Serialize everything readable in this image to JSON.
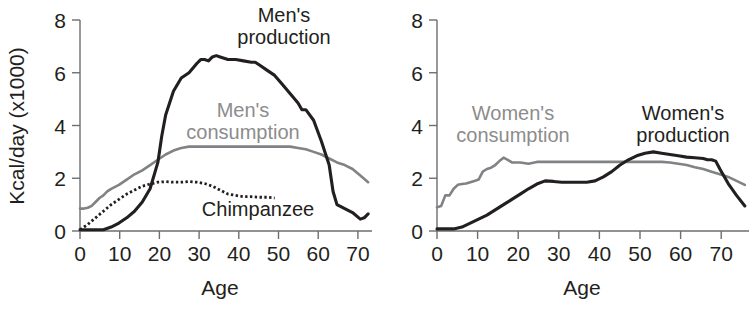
{
  "figure": {
    "title": "",
    "background_color": "#ffffff",
    "colors": {
      "dark": "#231f20",
      "gray": "#808285",
      "gray_label": "#8c8c8c",
      "axis": "#6d6e71"
    }
  },
  "panels": [
    {
      "id": "men",
      "ylabel": "Kcal/day (x1000)",
      "xlabel": "Age",
      "y_ticks": [
        "0",
        "2",
        "4",
        "6",
        "8"
      ],
      "x_ticks": [
        "0",
        "10",
        "20",
        "30",
        "40",
        "50",
        "60",
        "70"
      ],
      "labels": [
        {
          "name": "mens-production-label",
          "line1": "Men's",
          "line2": "production",
          "color": "dark"
        },
        {
          "name": "mens-consumption-label",
          "line1": "Men's",
          "line2": "consumption",
          "color": "gray"
        },
        {
          "name": "chimpanzee-label",
          "line1": "Chimpanzee",
          "line2": "",
          "color": "dark"
        }
      ]
    },
    {
      "id": "women",
      "ylabel": "",
      "xlabel": "Age",
      "y_ticks": [
        "0",
        "2",
        "4",
        "6",
        "8"
      ],
      "x_ticks": [
        "0",
        "10",
        "20",
        "30",
        "40",
        "50",
        "60",
        "70"
      ],
      "labels": [
        {
          "name": "womens-consumption-label",
          "line1": "Women's",
          "line2": "consumption",
          "color": "gray"
        },
        {
          "name": "womens-production-label",
          "line1": "Women's",
          "line2": "production",
          "color": "dark"
        }
      ]
    }
  ],
  "chart_data": [
    {
      "type": "line",
      "title": "Men's production and consumption vs. chimpanzee",
      "xlabel": "Age",
      "ylabel": "Kcal/day (x1000)",
      "xlim": [
        0,
        75
      ],
      "ylim": [
        0,
        8
      ],
      "xticks": [
        0,
        10,
        20,
        30,
        40,
        50,
        60,
        70
      ],
      "yticks": [
        0,
        2,
        4,
        6,
        8
      ],
      "grid": false,
      "legend": "inline-annotations",
      "series": [
        {
          "name": "Men's production",
          "style": "solid",
          "color": "#231f20",
          "x": [
            0,
            2,
            4,
            6,
            8,
            10,
            12,
            14,
            16,
            18,
            20,
            21,
            22,
            24,
            26,
            28,
            30,
            31,
            32,
            33,
            34,
            35,
            36,
            38,
            40,
            42,
            44,
            45,
            46,
            48,
            50,
            52,
            54,
            56,
            57,
            58,
            60,
            62,
            64,
            65,
            66,
            68,
            70,
            72,
            73,
            74
          ],
          "y": [
            0.05,
            0.05,
            0.05,
            0.05,
            0.15,
            0.3,
            0.5,
            0.75,
            1.1,
            1.6,
            2.6,
            3.6,
            4.4,
            5.3,
            5.8,
            6.0,
            6.35,
            6.5,
            6.5,
            6.45,
            6.6,
            6.65,
            6.6,
            6.5,
            6.5,
            6.45,
            6.4,
            6.4,
            6.3,
            6.1,
            5.9,
            5.55,
            5.2,
            4.85,
            4.6,
            4.6,
            4.2,
            3.4,
            2.5,
            1.5,
            1.0,
            0.85,
            0.7,
            0.45,
            0.5,
            0.65
          ]
        },
        {
          "name": "Men's consumption",
          "style": "solid",
          "color": "#808285",
          "x": [
            0,
            1,
            2,
            3,
            4,
            5,
            6,
            7,
            8,
            10,
            12,
            14,
            16,
            18,
            20,
            22,
            24,
            26,
            28,
            30,
            34,
            38,
            42,
            46,
            50,
            54,
            56,
            58,
            60,
            62,
            64,
            66,
            68,
            70,
            72,
            74
          ],
          "y": [
            0.85,
            0.85,
            0.88,
            0.95,
            1.1,
            1.25,
            1.35,
            1.5,
            1.6,
            1.75,
            1.95,
            2.15,
            2.3,
            2.5,
            2.7,
            2.9,
            3.05,
            3.15,
            3.2,
            3.2,
            3.2,
            3.2,
            3.2,
            3.2,
            3.2,
            3.2,
            3.15,
            3.1,
            3.0,
            2.9,
            2.75,
            2.6,
            2.5,
            2.35,
            2.1,
            1.85
          ]
        },
        {
          "name": "Chimpanzee",
          "style": "dotted",
          "color": "#231f20",
          "x": [
            0,
            2,
            4,
            6,
            8,
            10,
            12,
            14,
            16,
            18,
            20,
            22,
            24,
            26,
            28,
            30,
            32,
            34,
            36,
            38,
            40,
            42,
            44,
            46,
            48,
            50
          ],
          "y": [
            0.05,
            0.25,
            0.5,
            0.75,
            1.0,
            1.2,
            1.4,
            1.55,
            1.7,
            1.78,
            1.85,
            1.87,
            1.85,
            1.85,
            1.88,
            1.85,
            1.8,
            1.7,
            1.55,
            1.4,
            1.35,
            1.3,
            1.3,
            1.28,
            1.28,
            1.25
          ]
        }
      ]
    },
    {
      "type": "line",
      "title": "Women's production and consumption",
      "xlabel": "Age",
      "ylabel": "",
      "xlim": [
        0,
        75
      ],
      "ylim": [
        0,
        8
      ],
      "xticks": [
        0,
        10,
        20,
        30,
        40,
        50,
        60,
        70
      ],
      "yticks": [
        0,
        2,
        4,
        6,
        8
      ],
      "grid": false,
      "legend": "inline-annotations",
      "series": [
        {
          "name": "Women's production",
          "style": "solid",
          "color": "#231f20",
          "x": [
            0,
            2,
            4,
            6,
            8,
            10,
            12,
            14,
            16,
            18,
            20,
            22,
            24,
            26,
            28,
            30,
            32,
            34,
            36,
            38,
            40,
            42,
            44,
            46,
            48,
            50,
            52,
            54,
            56,
            58,
            60,
            62,
            64,
            65,
            66,
            67,
            68,
            70,
            72,
            74
          ],
          "y": [
            0.08,
            0.08,
            0.08,
            0.15,
            0.3,
            0.45,
            0.6,
            0.8,
            1.0,
            1.2,
            1.4,
            1.6,
            1.78,
            1.9,
            1.88,
            1.85,
            1.85,
            1.85,
            1.85,
            1.9,
            2.05,
            2.25,
            2.5,
            2.7,
            2.85,
            2.95,
            3.0,
            2.95,
            2.9,
            2.85,
            2.8,
            2.78,
            2.75,
            2.7,
            2.7,
            2.65,
            2.35,
            1.8,
            1.35,
            0.95
          ]
        },
        {
          "name": "Women's consumption",
          "style": "solid",
          "color": "#808285",
          "x": [
            0,
            1,
            2,
            3,
            4,
            5,
            6,
            7,
            8,
            9,
            10,
            11,
            12,
            13,
            14,
            15,
            16,
            17,
            18,
            20,
            22,
            24,
            26,
            30,
            34,
            38,
            42,
            46,
            50,
            52,
            54,
            56,
            58,
            60,
            62,
            64,
            66,
            68,
            70,
            72,
            74
          ],
          "y": [
            0.9,
            0.95,
            1.35,
            1.35,
            1.6,
            1.75,
            1.78,
            1.8,
            1.85,
            1.9,
            1.95,
            2.25,
            2.35,
            2.4,
            2.5,
            2.65,
            2.78,
            2.7,
            2.6,
            2.6,
            2.55,
            2.62,
            2.62,
            2.62,
            2.62,
            2.62,
            2.62,
            2.62,
            2.62,
            2.62,
            2.62,
            2.6,
            2.55,
            2.5,
            2.42,
            2.35,
            2.25,
            2.15,
            2.05,
            1.9,
            1.75
          ]
        }
      ]
    }
  ]
}
